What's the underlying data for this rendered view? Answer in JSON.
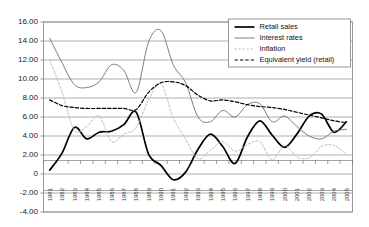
{
  "chart_data": {
    "type": "line",
    "title": "",
    "subtitle": "",
    "xlabel": "",
    "ylabel": "",
    "xlim": [
      1981,
      2005
    ],
    "ylim": [
      -4.0,
      16.0
    ],
    "grid": true,
    "legend_position": "top-right",
    "x": [
      1981,
      1982,
      1983,
      1984,
      1985,
      1986,
      1987,
      1988,
      1989,
      1990,
      1991,
      1992,
      1993,
      1994,
      1995,
      1996,
      1997,
      1998,
      1999,
      2000,
      2001,
      2002,
      2003,
      2004,
      2005
    ],
    "categories": [
      "1981",
      "1982",
      "1983",
      "1984",
      "1985",
      "1986",
      "1987",
      "1988",
      "1989",
      "1990",
      "1991",
      "1992",
      "1993",
      "1994",
      "1995",
      "1996",
      "1997",
      "1998",
      "1999",
      "2000",
      "2001",
      "2002",
      "2003",
      "2004",
      "2005"
    ],
    "yticks": [
      -4.0,
      -2.0,
      0,
      2.0,
      4.0,
      6.0,
      8.0,
      10.0,
      12.0,
      14.0,
      16.0
    ],
    "ytick_labels": [
      "-4.00",
      "-2.00",
      "0",
      "2.00",
      "4.00",
      "6.00",
      "8.00",
      "10.00",
      "12.00",
      "14.00",
      "16.00"
    ],
    "series": [
      {
        "name": "Retail sales",
        "style": "solid",
        "color": "#000000",
        "width": 1.7,
        "values": [
          0.4,
          2.2,
          4.9,
          3.7,
          4.4,
          4.5,
          5.2,
          6.5,
          2.1,
          0.9,
          -0.6,
          0.2,
          2.6,
          4.2,
          2.9,
          1.1,
          3.9,
          5.6,
          4.1,
          2.8,
          4.2,
          6.1,
          6.3,
          4.4,
          5.5
        ]
      },
      {
        "name": "Interest rates",
        "style": "solid",
        "color": "#6e6e6e",
        "width": 0.9,
        "values": [
          14.3,
          11.7,
          9.4,
          9.1,
          9.7,
          11.5,
          10.9,
          8.6,
          13.9,
          15.1,
          11.5,
          9.6,
          6.0,
          5.5,
          6.7,
          6.0,
          7.3,
          7.4,
          5.5,
          6.1,
          5.0,
          4.0,
          3.7,
          4.5,
          4.7
        ]
      },
      {
        "name": "Inflation",
        "style": "dotted",
        "color": "#b4b4b4",
        "width": 0.9,
        "values": [
          12.0,
          8.6,
          4.6,
          5.0,
          6.1,
          3.4,
          4.2,
          4.9,
          7.8,
          9.5,
          5.9,
          3.7,
          1.6,
          2.5,
          3.4,
          2.4,
          3.1,
          3.4,
          1.5,
          3.0,
          1.8,
          1.7,
          2.9,
          3.0,
          2.1
        ]
      },
      {
        "name": "Equivalent yield (retail)",
        "style": "dashed",
        "color": "#000000",
        "width": 1.2,
        "values": [
          7.8,
          7.2,
          7.0,
          6.9,
          6.9,
          6.9,
          6.9,
          6.8,
          8.6,
          9.6,
          9.7,
          9.3,
          8.3,
          7.7,
          7.8,
          7.6,
          7.3,
          7.1,
          7.0,
          6.8,
          6.5,
          6.2,
          5.9,
          5.6,
          5.4
        ]
      }
    ]
  },
  "legend": {
    "items": [
      {
        "label": "Retail sales",
        "swatch": "solid-thick-black"
      },
      {
        "label": "Interest rates",
        "swatch": "solid-thin-gray"
      },
      {
        "label": "Inflation",
        "swatch": "dotted-gray"
      },
      {
        "label": "Equivalent yield (retail)",
        "swatch": "dashed-black"
      }
    ]
  }
}
